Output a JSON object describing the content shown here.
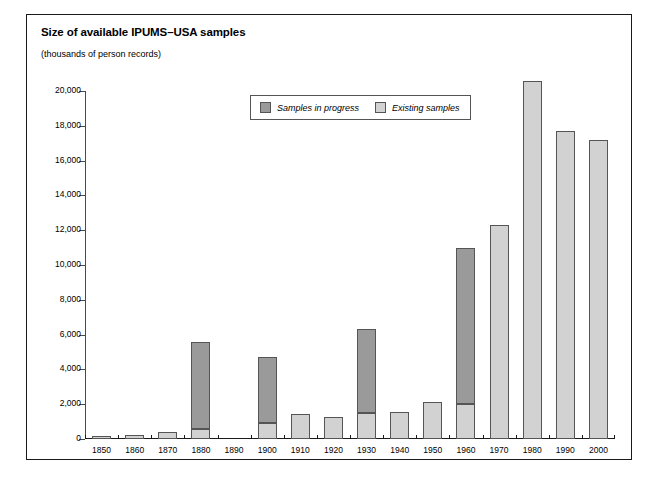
{
  "chart_data": {
    "type": "bar",
    "title": "Size of available IPUMS–USA samples",
    "subtitle": "(thousands of person records)",
    "xlabel": "",
    "ylabel": "",
    "ylim": [
      0,
      20000
    ],
    "ytick_step": 2000,
    "grid": false,
    "stacked": true,
    "legend_position": "top-center",
    "categories": [
      "1850",
      "1860",
      "1870",
      "1880",
      "1890",
      "1900",
      "1910",
      "1920",
      "1930",
      "1940",
      "1950",
      "1960",
      "1970",
      "1980",
      "1990",
      "2000"
    ],
    "ytick_labels": [
      "0",
      "2,000",
      "4,000",
      "6,000",
      "8,000",
      "10,000",
      "12,000",
      "14,000",
      "16,000",
      "18,000",
      "20,000"
    ],
    "ytick_values": [
      0,
      2000,
      4000,
      6000,
      8000,
      10000,
      12000,
      14000,
      16000,
      18000,
      20000
    ],
    "series": [
      {
        "name": "Existing samples",
        "color": "#d2d2d2",
        "values": [
          200,
          250,
          400,
          600,
          0,
          900,
          1450,
          1250,
          1500,
          1550,
          2100,
          2000,
          12300,
          20600,
          17700,
          17200
        ]
      },
      {
        "name": "Samples in progress",
        "color": "#9a9a9a",
        "values": [
          0,
          0,
          0,
          5000,
          0,
          3800,
          0,
          0,
          4800,
          0,
          0,
          9000,
          0,
          0,
          0,
          0
        ]
      }
    ],
    "totals": [
      200,
      250,
      400,
      5600,
      0,
      4700,
      1450,
      1250,
      6300,
      1550,
      2100,
      11000,
      12300,
      20600,
      17700,
      17200
    ]
  },
  "legend": {
    "items": [
      {
        "label": "Samples in progress",
        "swatch": "#9a9a9a"
      },
      {
        "label": "Existing samples",
        "swatch": "#d2d2d2"
      }
    ]
  },
  "colors": {
    "frame_border": "#1a1a1a",
    "bar_outline": "#555555",
    "existing": "#d2d2d2",
    "in_progress": "#9a9a9a",
    "text": "#000000"
  }
}
